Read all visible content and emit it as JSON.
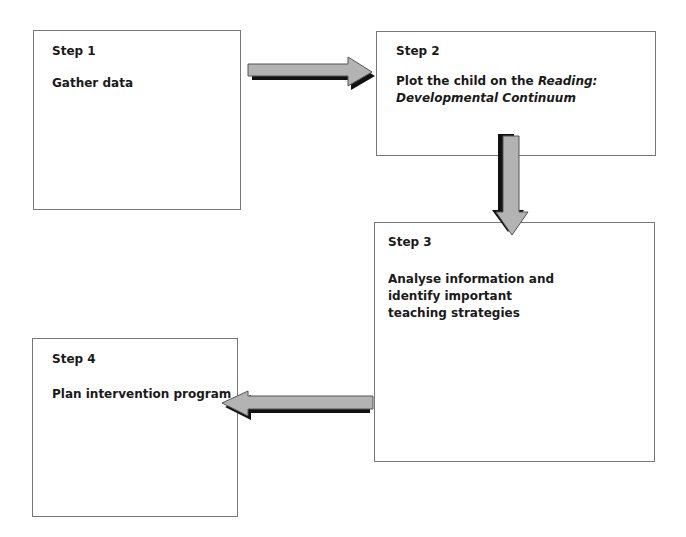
{
  "diagram": {
    "type": "flowchart",
    "colors": {
      "box_border": "#777777",
      "arrow_fill": "#b3b3b3",
      "arrow_stroke": "#555555",
      "arrow_shadow": "#111111",
      "text": "#1a1a1a"
    },
    "steps": [
      {
        "label": "Step 1",
        "text": "Gather data"
      },
      {
        "label": "Step 2",
        "text_plain": "Plot the child on the ",
        "text_italic_1": "Reading:",
        "text_italic_2": "Developmental Continuum"
      },
      {
        "label": "Step 3",
        "text_line_1": "Analyse information and",
        "text_line_2": "identify important",
        "text_line_3": "teaching strategies"
      },
      {
        "label": "Step 4",
        "text": "Plan intervention program"
      }
    ],
    "arrows": [
      {
        "from": "Step 1",
        "to": "Step 2",
        "direction": "right"
      },
      {
        "from": "Step 2",
        "to": "Step 3",
        "direction": "down"
      },
      {
        "from": "Step 3",
        "to": "Step 4",
        "direction": "left"
      }
    ]
  }
}
